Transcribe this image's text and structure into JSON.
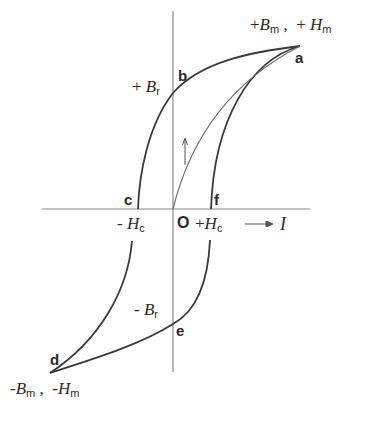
{
  "diagram": {
    "title": "",
    "type": "B-H hysteresis loop",
    "colors": {
      "axis": "#8a8a8a",
      "loop": "#3a3a3a",
      "initial_curve": "#6a6a6a",
      "text": "#2a2a2a"
    },
    "points": {
      "a": "a",
      "b": "b",
      "c": "c",
      "d": "d",
      "e": "e",
      "f": "f",
      "origin": "O"
    },
    "labels": {
      "pos_max": {
        "sign_B": "+",
        "B": "B",
        "B_sub": "m",
        "sep": " ,  ",
        "sign_H": "+ ",
        "H": "H",
        "H_sub": "m"
      },
      "neg_max": {
        "sign_B": "-",
        "B": "B",
        "B_sub": "m",
        "sep": " ,  ",
        "sign_H": "-",
        "H": "H",
        "H_sub": "m"
      },
      "pos_Br": {
        "sign": "+ ",
        "sym": "B",
        "sub": "r"
      },
      "neg_Br": {
        "sign": "- ",
        "sym": "B",
        "sub": "r"
      },
      "neg_Hc": {
        "sign": "- ",
        "sym": "H",
        "sub": "c"
      },
      "pos_Hc": {
        "sign": "+",
        "sym": "H",
        "sub": "c"
      },
      "current_arrow": "→",
      "current": "I"
    },
    "curves": [
      {
        "name": "upper-branch",
        "path": [
          "d",
          "c",
          "b",
          "a"
        ]
      },
      {
        "name": "lower-branch",
        "path": [
          "a",
          "f",
          "e",
          "d"
        ]
      },
      {
        "name": "initial-magnetization",
        "path": [
          "O",
          "a"
        ]
      }
    ]
  }
}
